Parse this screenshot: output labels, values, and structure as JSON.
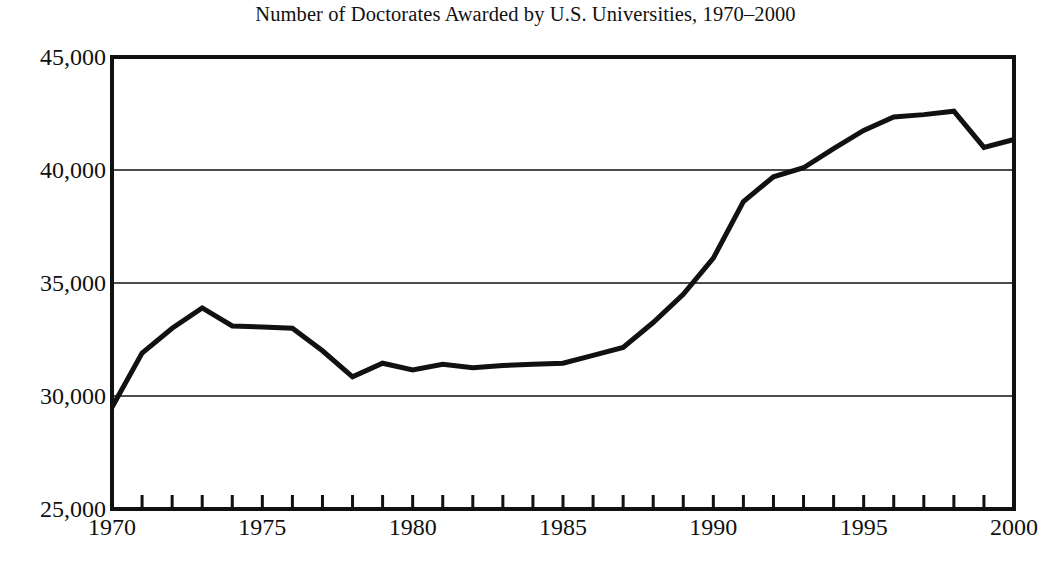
{
  "chart_data": {
    "type": "line",
    "title": "Number of Doctorates Awarded by U.S. Universities, 1970–2000",
    "xlabel": "",
    "ylabel": "",
    "xlim": [
      1970,
      2000
    ],
    "ylim": [
      25000,
      45000
    ],
    "grid": "horizontal",
    "legend": "none",
    "x_tick_labels": [
      "1970",
      "1975",
      "1980",
      "1985",
      "1990",
      "1995",
      "2000"
    ],
    "x_tick_values": [
      1970,
      1975,
      1980,
      1985,
      1990,
      1995,
      2000
    ],
    "x_minor_tick_step": 1,
    "y_tick_labels": [
      "25,000",
      "30,000",
      "35,000",
      "40,000",
      "45,000"
    ],
    "y_tick_values": [
      25000,
      30000,
      35000,
      40000,
      45000
    ],
    "line_color": "#111111",
    "line_width_px": 5,
    "series": [
      {
        "name": "Doctorates awarded",
        "x": [
          1970,
          1971,
          1972,
          1973,
          1974,
          1975,
          1976,
          1977,
          1978,
          1979,
          1980,
          1981,
          1982,
          1983,
          1984,
          1985,
          1986,
          1987,
          1988,
          1989,
          1990,
          1991,
          1992,
          1993,
          1994,
          1995,
          1996,
          1997,
          1998,
          1999,
          2000
        ],
        "values": [
          29500,
          31900,
          33000,
          33900,
          33100,
          33050,
          33000,
          32000,
          30850,
          31450,
          31150,
          31400,
          31250,
          31350,
          31400,
          31450,
          31800,
          32150,
          33250,
          34500,
          36100,
          38600,
          39700,
          40100,
          40950,
          41750,
          42350,
          42450,
          42600,
          41000,
          41350
        ]
      }
    ]
  },
  "axes": {
    "y_labels": [
      "45,000",
      "40,000",
      "35,000",
      "30,000",
      "25,000"
    ],
    "x_labels": [
      "1970",
      "1975",
      "1980",
      "1985",
      "1990",
      "1995",
      "2000"
    ]
  }
}
